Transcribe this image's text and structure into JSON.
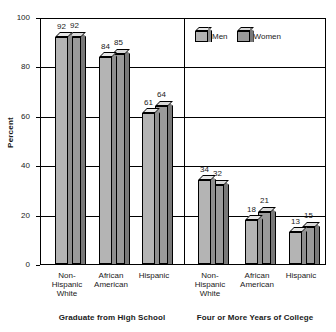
{
  "chart_data": {
    "type": "bar",
    "title": "",
    "xlabel": "",
    "ylabel": "Percent",
    "ylim": [
      0,
      100
    ],
    "yticks": [
      0,
      20,
      40,
      60,
      80,
      100
    ],
    "grid": true,
    "legend_position": "top-right",
    "series": [
      {
        "name": "Men",
        "values": [
          92,
          84,
          61,
          34,
          18,
          13
        ]
      },
      {
        "name": "Women",
        "values": [
          92,
          85,
          64,
          32,
          21,
          15
        ]
      }
    ],
    "categories": [
      "Non-Hispanic White",
      "African American",
      "Hispanic",
      "Non-Hispanic White",
      "African American",
      "Hispanic"
    ],
    "panels": [
      {
        "title": "Graduate from High School",
        "categories": [
          "Non-\nHispanic\nWhite",
          "African\nAmerican",
          "Hispanic"
        ],
        "groups": [
          {
            "category": "Non-Hispanic White",
            "men": 92,
            "women": 92
          },
          {
            "category": "African American",
            "men": 84,
            "women": 85
          },
          {
            "category": "Hispanic",
            "men": 61,
            "women": 64
          }
        ]
      },
      {
        "title": "Four or More Years of College",
        "categories": [
          "Non-\nHispanic\nWhite",
          "African\nAmerican",
          "Hispanic"
        ],
        "groups": [
          {
            "category": "Non-Hispanic White",
            "men": 34,
            "women": 32
          },
          {
            "category": "African American",
            "men": 18,
            "women": 21
          },
          {
            "category": "Hispanic",
            "men": 13,
            "women": 15
          }
        ]
      }
    ],
    "colors": {
      "men_face": "#b4b4b4",
      "men_top": "#e8e8e8",
      "men_side": "#8e8e8e",
      "women_face": "#9a9a9a",
      "women_top": "#d8d8d8",
      "women_side": "#787878",
      "axis": "#000000",
      "background": "#ffffff"
    }
  },
  "axis": {
    "y_title": "Percent",
    "y_tick_labels": [
      "100",
      "80",
      "60",
      "40",
      "20",
      "0"
    ]
  },
  "legend": {
    "men_label": "Men",
    "women_label": "Women"
  },
  "panel_titles": {
    "left": "Graduate from High School",
    "right": "Four or More Years of College"
  },
  "category_labels": {
    "non_hispanic_white": "Non-\nHispanic\nWhite",
    "african_american": "African\nAmerican",
    "hispanic": "Hispanic"
  },
  "value_labels": {
    "hs_nhw_men": "92",
    "hs_nhw_women": "92",
    "hs_aa_men": "84",
    "hs_aa_women": "85",
    "hs_hisp_men": "61",
    "hs_hisp_women": "64",
    "col_nhw_men": "34",
    "col_nhw_women": "32",
    "col_aa_men": "18",
    "col_aa_women": "21",
    "col_hisp_men": "13",
    "col_hisp_women": "15"
  }
}
